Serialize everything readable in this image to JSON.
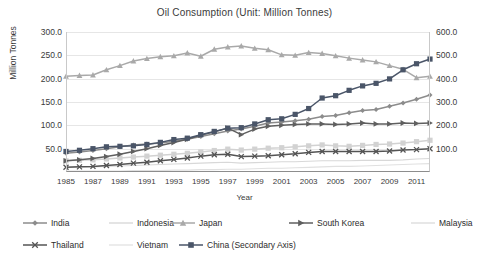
{
  "chart_data": {
    "type": "line",
    "title": "Oil Consumption (Unit: Million Tonnes)",
    "xlabel": "Year",
    "ylabel": "Million Tonnes",
    "ylabel_secondary": "",
    "grid": true,
    "legend_position": "bottom",
    "x": [
      1985,
      1986,
      1987,
      1988,
      1989,
      1990,
      1991,
      1992,
      1993,
      1994,
      1995,
      1996,
      1997,
      1998,
      1999,
      2000,
      2001,
      2002,
      2003,
      2004,
      2005,
      2006,
      2007,
      2008,
      2009,
      2010,
      2011,
      2012
    ],
    "xtick_labels": [
      "1985",
      "1987",
      "1989",
      "1991",
      "1993",
      "1995",
      "1997",
      "1999",
      "2001",
      "2003",
      "2005",
      "2007",
      "2009",
      "2011"
    ],
    "ylim": [
      0,
      300
    ],
    "yticks": [
      "50.0",
      "100.0",
      "150.0",
      "200.0",
      "250.0",
      "300.0"
    ],
    "ylim_secondary": [
      0,
      600
    ],
    "yticks_secondary": [
      "100.0",
      "200.0",
      "300.0",
      "400.0",
      "500.0",
      "600.0"
    ],
    "series": [
      {
        "name": "India",
        "axis": "primary",
        "marker": "diamond",
        "color": "#8c8c8c",
        "values": [
          40,
          43,
          46,
          50,
          54,
          58,
          60,
          62,
          66,
          70,
          76,
          82,
          88,
          92,
          98,
          105,
          107,
          110,
          113,
          119,
          121,
          127,
          132,
          134,
          141,
          148,
          156,
          165
        ]
      },
      {
        "name": "Indonesia",
        "axis": "primary",
        "marker": "square",
        "color": "#d2d2d2",
        "values": [
          24,
          25,
          26,
          28,
          30,
          32,
          34,
          36,
          38,
          40,
          43,
          46,
          49,
          47,
          49,
          51,
          52,
          54,
          56,
          58,
          56,
          55,
          57,
          59,
          60,
          62,
          65,
          68
        ]
      },
      {
        "name": "Japan",
        "axis": "primary",
        "marker": "triangle",
        "color": "#a9a9a9",
        "values": [
          205,
          207,
          208,
          219,
          228,
          238,
          243,
          247,
          249,
          255,
          248,
          263,
          268,
          270,
          265,
          262,
          251,
          250,
          256,
          254,
          249,
          244,
          240,
          236,
          228,
          220,
          202,
          205
        ]
      },
      {
        "name": "South Korea",
        "axis": "primary",
        "marker": "triangle-right",
        "color": "#5f5f5f",
        "values": [
          24,
          26,
          29,
          33,
          38,
          44,
          50,
          57,
          63,
          70,
          79,
          86,
          94,
          80,
          92,
          98,
          100,
          102,
          103,
          103,
          102,
          103,
          105,
          103,
          103,
          105,
          104,
          105
        ]
      },
      {
        "name": "Malaysia",
        "axis": "primary",
        "marker": "none",
        "color": "#d8d8d8",
        "values": [
          10,
          11,
          11,
          12,
          13,
          14,
          15,
          16,
          17,
          18,
          19,
          20,
          21,
          19,
          20,
          21,
          22,
          22,
          23,
          24,
          24,
          24,
          25,
          25,
          25,
          26,
          28,
          29
        ]
      },
      {
        "name": "Thailand",
        "axis": "primary",
        "marker": "x",
        "color": "#545454",
        "values": [
          10,
          11,
          12,
          14,
          16,
          19,
          21,
          24,
          27,
          30,
          34,
          37,
          38,
          33,
          34,
          35,
          37,
          39,
          42,
          44,
          44,
          44,
          44,
          44,
          45,
          47,
          48,
          50
        ]
      },
      {
        "name": "Vietnam",
        "axis": "primary",
        "marker": "none",
        "color": "#e0e0e0",
        "values": [
          2,
          2,
          2,
          2,
          2,
          3,
          3,
          3,
          4,
          4,
          5,
          5,
          6,
          6,
          7,
          8,
          8,
          9,
          10,
          11,
          12,
          12,
          13,
          14,
          15,
          16,
          17,
          18
        ]
      },
      {
        "name": "China (Secondary Axis)",
        "axis": "secondary",
        "marker": "square",
        "color": "#4a5568",
        "values": [
          88,
          93,
          100,
          108,
          110,
          112,
          118,
          127,
          139,
          145,
          160,
          174,
          188,
          190,
          206,
          224,
          228,
          247,
          272,
          317,
          327,
          350,
          369,
          380,
          399,
          438,
          464,
          484
        ]
      }
    ]
  },
  "legend": {
    "rows": [
      [
        {
          "label": "India",
          "marker": "diamond",
          "color": "#8c8c8c"
        },
        {
          "label": "Indonesia",
          "marker": "none",
          "color": "#d2d2d2"
        },
        {
          "label": "Japan",
          "marker": "triangle",
          "color": "#a9a9a9"
        },
        {
          "label": "South Korea",
          "marker": "triangle-right",
          "color": "#5f5f5f"
        },
        {
          "label": "Malaysia",
          "marker": "none",
          "color": "#d8d8d8"
        }
      ],
      [
        {
          "label": "Thailand",
          "marker": "x",
          "color": "#545454"
        },
        {
          "label": "Vietnam",
          "marker": "none",
          "color": "#e0e0e0"
        },
        {
          "label": "China (Secondary Axis)",
          "marker": "square",
          "color": "#4a5568"
        }
      ]
    ]
  }
}
